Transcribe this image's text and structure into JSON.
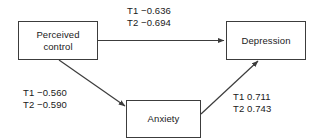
{
  "diagram": {
    "type": "path-model",
    "background_color": "#ffffff",
    "stroke_color": "#3c3c3c",
    "text_color": "#1a1a1a",
    "nodes": [
      {
        "id": "perceived_control",
        "label": "Perceived\ncontrol"
      },
      {
        "id": "depression",
        "label": "Depression"
      },
      {
        "id": "anxiety",
        "label": "Anxiety"
      }
    ],
    "edges": [
      {
        "id": "control_to_depression",
        "from": "perceived_control",
        "to": "depression",
        "label": "T1 −0.636\nT2 −0.694",
        "coefficients": [
          {
            "time": "T1",
            "value": -0.636
          },
          {
            "time": "T2",
            "value": -0.694
          }
        ]
      },
      {
        "id": "control_to_anxiety",
        "from": "perceived_control",
        "to": "anxiety",
        "label": "T1 −0.560\nT2 −0.590",
        "coefficients": [
          {
            "time": "T1",
            "value": -0.56
          },
          {
            "time": "T2",
            "value": -0.59
          }
        ]
      },
      {
        "id": "anxiety_to_depression",
        "from": "anxiety",
        "to": "depression",
        "label": "T1 0.711\nT2 0.743",
        "coefficients": [
          {
            "time": "T1",
            "value": 0.711
          },
          {
            "time": "T2",
            "value": 0.743
          }
        ]
      }
    ]
  }
}
